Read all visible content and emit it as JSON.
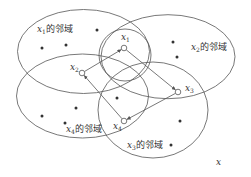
{
  "diagram": {
    "space_label": "x",
    "suffix": "的邻域",
    "neighborhoods": [
      {
        "id": "n1",
        "var": "x",
        "sub": "1",
        "label": "x1的邻域",
        "cx": 83.5,
        "cy": 51.5,
        "rx": 66,
        "ry": 42,
        "label_x": 37,
        "label_y": 25
      },
      {
        "id": "n2",
        "var": "x",
        "sub": "2",
        "label": "x2的邻域",
        "cx": 168,
        "cy": 56.7,
        "rx": 67,
        "ry": 42,
        "label_x": 191,
        "label_y": 43
      },
      {
        "id": "n4",
        "var": "x",
        "sub": "4",
        "label": "x4的邻域",
        "cx": 82.5,
        "cy": 96,
        "rx": 66,
        "ry": 42,
        "label_x": 66,
        "label_y": 125
      },
      {
        "id": "n3",
        "var": "x",
        "sub": "3",
        "label": "x3的邻域",
        "cx": 153,
        "cy": 110,
        "rx": 55,
        "ry": 48,
        "label_x": 127,
        "label_y": 141
      }
    ],
    "inner_circle": {
      "cx": 125,
      "cy": 55,
      "r": 26
    },
    "nodes": [
      {
        "id": "x1",
        "var": "x",
        "sub": "1",
        "x": 124,
        "y": 48,
        "label_x": 121,
        "label_y": 33
      },
      {
        "id": "x2",
        "var": "x",
        "sub": "2",
        "x": 82,
        "y": 73,
        "label_x": 70,
        "label_y": 63
      },
      {
        "id": "x3",
        "var": "x",
        "sub": "3",
        "x": 178,
        "y": 92,
        "label_x": 185,
        "label_y": 84
      },
      {
        "id": "x4",
        "var": "x",
        "sub": "4",
        "x": 124,
        "y": 121,
        "label_x": 113,
        "label_y": 122
      }
    ],
    "edges": [
      {
        "from": "x2",
        "to": "x1"
      },
      {
        "from": "x1",
        "to": "x3"
      },
      {
        "from": "x3",
        "to": "x4"
      },
      {
        "from": "x4",
        "to": "x2"
      }
    ],
    "points": [
      [
        97,
        30
      ],
      [
        42,
        48
      ],
      [
        66,
        45
      ],
      [
        173,
        42
      ],
      [
        177,
        57
      ],
      [
        117,
        98
      ],
      [
        76,
        108
      ],
      [
        42,
        116
      ],
      [
        65,
        123
      ],
      [
        180,
        121
      ],
      [
        171,
        145
      ]
    ],
    "colors": {
      "stroke": "#555555",
      "dot": "#333333",
      "text": "#333333"
    }
  }
}
